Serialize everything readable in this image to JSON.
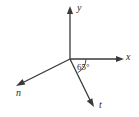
{
  "figure": {
    "kind": "vector-axes-diagram",
    "background_color": "#ffffff",
    "stroke_color": "#3a3a3a",
    "text_color": "#2b2b2b",
    "origin": {
      "x": 70,
      "y": 59
    },
    "axes": [
      {
        "id": "y-axis",
        "label": "y",
        "direction": "up",
        "tip": {
          "x": 70,
          "y": 8
        },
        "arrowhead": true
      },
      {
        "id": "x-axis",
        "label": "x",
        "direction": "right",
        "tip": {
          "x": 122,
          "y": 59
        },
        "arrowhead": true
      },
      {
        "id": "n-axis",
        "label": "n",
        "direction": "down-left",
        "tip": {
          "x": 18,
          "y": 85
        },
        "arrowhead": true
      },
      {
        "id": "t-axis",
        "label": "t",
        "direction": "down-right",
        "tip": {
          "x": 93,
          "y": 106
        },
        "arrowhead": true
      }
    ],
    "angle_marker": {
      "label": "65°",
      "value": 65,
      "unit": "degrees",
      "from_axis": "x-axis",
      "to_axis": "t-axis",
      "arc_radius": 16
    }
  }
}
